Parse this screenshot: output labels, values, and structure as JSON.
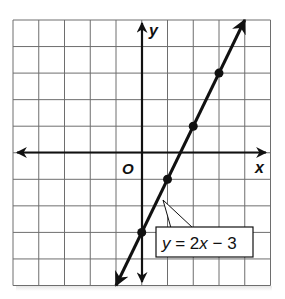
{
  "graph": {
    "axis_labels": {
      "x": "x",
      "y": "y",
      "origin": "O"
    },
    "equation_label": "y = 2x − 3",
    "equation_parts": {
      "y": "y",
      "eq": " = 2",
      "x": "x",
      "rest": " − 3"
    },
    "grid": {
      "x_min": -5,
      "x_max": 5,
      "y_min": -5,
      "y_max": 5,
      "step": 1
    },
    "line": {
      "slope": 2,
      "intercept": -3
    },
    "points": [
      {
        "x": 0,
        "y": -3
      },
      {
        "x": 1,
        "y": -1
      },
      {
        "x": 2,
        "y": 1
      },
      {
        "x": 3,
        "y": 3
      }
    ],
    "colors": {
      "grid": "#6e6e6e",
      "axes": "#111111",
      "line": "#111111",
      "background": "#ffffff"
    }
  }
}
